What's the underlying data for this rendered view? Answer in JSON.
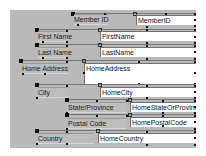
{
  "window": {
    "type": "form-design-view",
    "panel_color": "#b9b9b9"
  },
  "fields": [
    {
      "label": "Member ID",
      "control": "MemberID"
    },
    {
      "label": "First Name",
      "control": "FirstName"
    },
    {
      "label": "Last Name",
      "control": "LastName"
    },
    {
      "label": "Home Address",
      "control": "HomeAddress"
    },
    {
      "label": "City",
      "control": "HomeCity"
    },
    {
      "label": "State/Province",
      "control": "HomeStateOrProvinc"
    },
    {
      "label": "Postal Code",
      "control": "HomePostalCode"
    },
    {
      "label": "Country",
      "control": "HomeCountry"
    }
  ],
  "icons": {
    "move_handle": "filled-square",
    "size_handle": "small-square"
  }
}
